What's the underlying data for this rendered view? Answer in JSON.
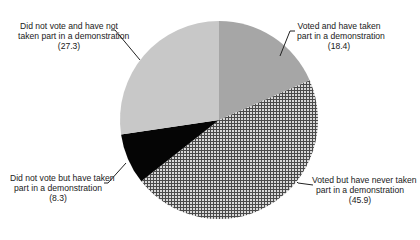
{
  "chart_data": {
    "type": "pie",
    "title": "",
    "start_angle_deg": 0,
    "direction": "clockwise",
    "slices": [
      {
        "label": "Voted and have taken part in a demonstration",
        "value": 18.4,
        "fill": "#a6a6a6",
        "pattern": "solid"
      },
      {
        "label": "Voted but have never taken part in a demonstration",
        "value": 45.9,
        "fill": "#7a7a7a",
        "pattern": "crosshatch"
      },
      {
        "label": "Did not vote but have taken part in a demonstration",
        "value": 8.3,
        "fill": "#050505",
        "pattern": "solid"
      },
      {
        "label": "Did not vote and have not taken part in a demonstration",
        "value": 27.3,
        "fill": "#c8c8c8",
        "pattern": "solid"
      }
    ],
    "legend": "none",
    "data_labels": "outside with leader lines"
  },
  "labels": {
    "voted_demo": {
      "line1": "Voted and have taken",
      "line2": "part in a demonstration",
      "value": "(18.4)"
    },
    "voted_nodemo": {
      "line1": "Voted but have never taken",
      "line2": "part in a demonstration",
      "value": "(45.9)"
    },
    "novote_demo": {
      "line1": "Did not vote but have taken",
      "line2": "part in a demonstration",
      "value": "(8.3)"
    },
    "novote_nodemo": {
      "line1": "Did not vote and have not",
      "line2": "taken part in a demonstration",
      "value": "(27.3)"
    }
  }
}
